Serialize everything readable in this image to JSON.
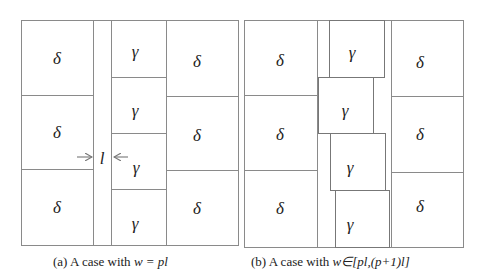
{
  "colors": {
    "line": "#8a8a8a",
    "text": "#222222",
    "background": "#ffffff"
  },
  "panels": [
    {
      "id": "a",
      "caption": {
        "prefix": "(a) A case with ",
        "math": "w = pl"
      },
      "frame": {
        "x": 21,
        "y": 20,
        "w": 217,
        "h": 225
      },
      "lines": [
        [
          93,
          20,
          93,
          245
        ],
        [
          111,
          20,
          111,
          245
        ],
        [
          166,
          20,
          166,
          245
        ],
        [
          21,
          95,
          93,
          95
        ],
        [
          21,
          169,
          93,
          169
        ],
        [
          111,
          77,
          166,
          77
        ],
        [
          111,
          133,
          166,
          133
        ],
        [
          111,
          189,
          166,
          189
        ],
        [
          166,
          96,
          238,
          96
        ],
        [
          166,
          170,
          238,
          170
        ]
      ],
      "cells": [
        {
          "label": "δ",
          "x": 57,
          "y": 60
        },
        {
          "label": "δ",
          "x": 57,
          "y": 134
        },
        {
          "label": "δ",
          "x": 57,
          "y": 209
        },
        {
          "label": "γ",
          "x": 135,
          "y": 53
        },
        {
          "label": "γ",
          "x": 135,
          "y": 112
        },
        {
          "label": "γ",
          "x": 136,
          "y": 169
        },
        {
          "label": "γ",
          "x": 135,
          "y": 225
        },
        {
          "label": "δ",
          "x": 197,
          "y": 63
        },
        {
          "label": "δ",
          "x": 197,
          "y": 137
        },
        {
          "label": "δ",
          "x": 197,
          "y": 210
        }
      ],
      "annotation": {
        "label": "l",
        "x": 102,
        "y": 160
      },
      "arrows": [
        {
          "from": [
            77,
            157
          ],
          "to": [
            92,
            157
          ]
        },
        {
          "from": [
            128,
            157
          ],
          "to": [
            114,
            157
          ]
        }
      ]
    },
    {
      "id": "b",
      "caption": {
        "prefix": "(b) A case with  ",
        "math": "w∈[pl,(p+1)l]"
      },
      "frame": {
        "x": 244,
        "y": 20,
        "w": 219,
        "h": 227
      },
      "lines": [
        [
          317,
          20,
          317,
          247
        ],
        [
          391,
          20,
          391,
          247
        ],
        [
          244,
          95,
          317,
          95
        ],
        [
          244,
          170,
          317,
          170
        ],
        [
          391,
          96,
          463,
          96
        ],
        [
          391,
          172,
          463,
          172
        ]
      ],
      "boxes": [
        {
          "x": 329,
          "y": 20,
          "w": 55,
          "h": 57
        },
        {
          "x": 318,
          "y": 77,
          "w": 55,
          "h": 56
        },
        {
          "x": 330,
          "y": 133,
          "w": 55,
          "h": 57
        },
        {
          "x": 335,
          "y": 190,
          "w": 54,
          "h": 57
        }
      ],
      "cells": [
        {
          "label": "δ",
          "x": 280,
          "y": 62
        },
        {
          "label": "δ",
          "x": 280,
          "y": 136
        },
        {
          "label": "δ",
          "x": 280,
          "y": 210
        },
        {
          "label": "γ",
          "x": 352,
          "y": 54
        },
        {
          "label": "γ",
          "x": 345,
          "y": 112
        },
        {
          "label": "γ",
          "x": 350,
          "y": 169
        },
        {
          "label": "γ",
          "x": 350,
          "y": 226
        },
        {
          "label": "δ",
          "x": 420,
          "y": 64
        },
        {
          "label": "δ",
          "x": 420,
          "y": 136
        },
        {
          "label": "δ",
          "x": 420,
          "y": 208
        }
      ]
    }
  ]
}
